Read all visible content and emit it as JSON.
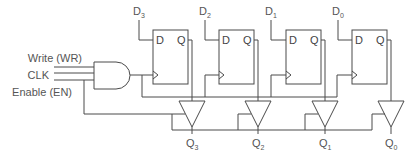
{
  "diagram": {
    "inputs": {
      "write": "Write (WR)",
      "clk": "CLK",
      "enable": "Enable (EN)"
    },
    "flipflops": [
      {
        "data_label": "D",
        "data_sub": "3",
        "d_pin": "D",
        "q_pin": "Q",
        "out_label": "Q",
        "out_sub": "3"
      },
      {
        "data_label": "D",
        "data_sub": "2",
        "d_pin": "D",
        "q_pin": "Q",
        "out_label": "Q",
        "out_sub": "2"
      },
      {
        "data_label": "D",
        "data_sub": "1",
        "d_pin": "D",
        "q_pin": "Q",
        "out_label": "Q",
        "out_sub": "1"
      },
      {
        "data_label": "D",
        "data_sub": "0",
        "d_pin": "D",
        "q_pin": "Q",
        "out_label": "Q",
        "out_sub": "0"
      }
    ],
    "colors": {
      "line": "#4a4a4a",
      "text": "#555555",
      "background": "#ffffff"
    }
  }
}
